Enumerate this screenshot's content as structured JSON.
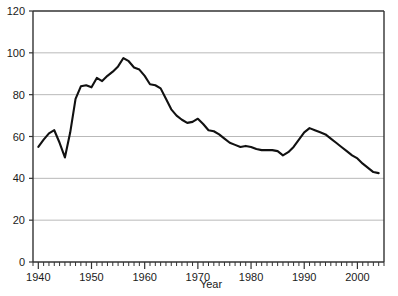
{
  "chart_data": {
    "type": "line",
    "title": "",
    "subtitle": "",
    "xlabel": "Year",
    "ylabel": "",
    "xlim": [
      1939,
      2005
    ],
    "ylim": [
      0,
      120
    ],
    "grid": true,
    "grid_axis": "y",
    "legend": false,
    "legend_position": "none",
    "y_ticks": [
      0,
      20,
      40,
      60,
      80,
      100,
      120
    ],
    "y_tick_labels": [
      "0",
      "20",
      "40",
      "60",
      "80",
      "100",
      "120"
    ],
    "x_ticks": [
      1940,
      1950,
      1960,
      1970,
      1980,
      1990,
      2000
    ],
    "x_tick_labels": [
      "1940",
      "1950",
      "1960",
      "1970",
      "1980",
      "1990",
      "2000"
    ],
    "x_minor_tick_step": 1,
    "line_color": "#111111",
    "line_width": 2.1,
    "grid_color": "#b9b9b9",
    "frame_color": "#333333",
    "background_color": "#ffffff",
    "x": [
      1940,
      1941,
      1942,
      1943,
      1944,
      1945,
      1946,
      1947,
      1948,
      1949,
      1950,
      1951,
      1952,
      1953,
      1954,
      1955,
      1956,
      1957,
      1958,
      1959,
      1960,
      1961,
      1962,
      1963,
      1964,
      1965,
      1966,
      1967,
      1968,
      1969,
      1970,
      1971,
      1972,
      1973,
      1974,
      1975,
      1976,
      1977,
      1978,
      1979,
      1980,
      1981,
      1982,
      1983,
      1984,
      1985,
      1986,
      1987,
      1988,
      1989,
      1990,
      1991,
      1992,
      1993,
      1994,
      1995,
      1996,
      1997,
      1998,
      1999,
      2000,
      2001,
      2002,
      2003,
      2004
    ],
    "values": [
      55.0,
      58.5,
      61.5,
      63.0,
      57.0,
      50.0,
      62.0,
      78.0,
      84.0,
      84.5,
      83.5,
      88.0,
      86.5,
      89.0,
      91.0,
      93.5,
      97.5,
      96.0,
      93.0,
      92.0,
      89.0,
      85.0,
      84.5,
      83.0,
      78.0,
      73.0,
      70.0,
      68.0,
      66.5,
      67.0,
      68.5,
      66.0,
      63.0,
      62.5,
      61.0,
      59.0,
      57.0,
      56.0,
      55.0,
      55.5,
      55.0,
      54.0,
      53.5,
      53.5,
      53.5,
      53.0,
      51.0,
      52.5,
      55.0,
      58.5,
      62.0,
      64.0,
      63.0,
      62.0,
      61.0,
      59.0,
      57.0,
      55.0,
      53.0,
      51.0,
      49.5,
      47.0,
      45.0,
      43.0,
      42.5
    ],
    "series": [
      {
        "name": "series-1",
        "values": [
          55.0,
          58.5,
          61.5,
          63.0,
          57.0,
          50.0,
          62.0,
          78.0,
          84.0,
          84.5,
          83.5,
          88.0,
          86.5,
          89.0,
          91.0,
          93.5,
          97.5,
          96.0,
          93.0,
          92.0,
          89.0,
          85.0,
          84.5,
          83.0,
          78.0,
          73.0,
          70.0,
          68.0,
          66.5,
          67.0,
          68.5,
          66.0,
          63.0,
          62.5,
          61.0,
          59.0,
          57.0,
          56.0,
          55.0,
          55.5,
          55.0,
          54.0,
          53.5,
          53.5,
          53.5,
          53.0,
          51.0,
          52.5,
          55.0,
          58.5,
          62.0,
          64.0,
          63.0,
          62.0,
          61.0,
          59.0,
          57.0,
          55.0,
          53.0,
          51.0,
          49.5,
          47.0,
          45.0,
          43.0,
          42.5
        ]
      }
    ],
    "annotations": []
  }
}
